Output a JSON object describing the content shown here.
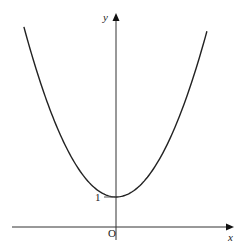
{
  "chart_data": {
    "type": "line",
    "title": "",
    "xlabel": "x",
    "ylabel": "y",
    "origin_label": "O",
    "annotations": [
      {
        "text": "1",
        "x": 0,
        "y": 1,
        "note": "y-intercept / minimum point"
      }
    ],
    "grid": false,
    "legend": null,
    "series": [
      {
        "name": "curve",
        "description": "U-shaped curve symmetric about the y-axis with minimum value 1 at x = 0",
        "x": [
          -3.07,
          -2.5,
          -2,
          -1.5,
          -1,
          -0.5,
          0,
          0.5,
          1,
          1.5,
          2,
          2.5,
          3.03
        ],
        "y": [
          6.67,
          4.5,
          3.2,
          2.2,
          1.55,
          1.13,
          1,
          1.13,
          1.55,
          2.2,
          3.2,
          4.5,
          6.7
        ]
      }
    ],
    "xlim": [
      -3.9,
      3.9
    ],
    "ylim": [
      -0.6,
      7.1
    ],
    "color": "#222222"
  },
  "labels": {
    "x_axis": "x",
    "y_axis": "y",
    "origin": "O",
    "intercept": "1"
  }
}
